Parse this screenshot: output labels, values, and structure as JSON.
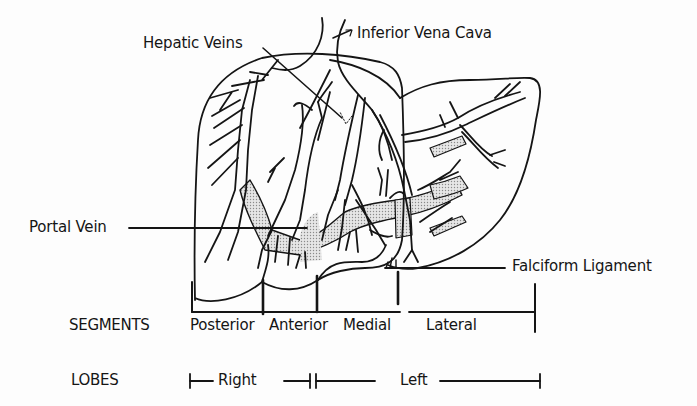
{
  "diagram": {
    "colors": {
      "ink": "#151515",
      "background": "#fdfdfd",
      "portal_fill": "#cfcfcf"
    },
    "callouts": {
      "hepatic_veins": "Hepatic Veins",
      "inferior_vena_cava": "Inferior Vena Cava",
      "portal_vein": "Portal Vein",
      "falciform_ligament": "Falciform Ligament"
    },
    "segments": {
      "row_label": "SEGMENTS",
      "items": [
        {
          "label": "Posterior"
        },
        {
          "label": "Anterior"
        },
        {
          "label": "Medial"
        },
        {
          "label": "Lateral"
        }
      ]
    },
    "lobes": {
      "row_label": "LOBES",
      "items": [
        {
          "label": "Right"
        },
        {
          "label": "Left"
        }
      ]
    }
  }
}
